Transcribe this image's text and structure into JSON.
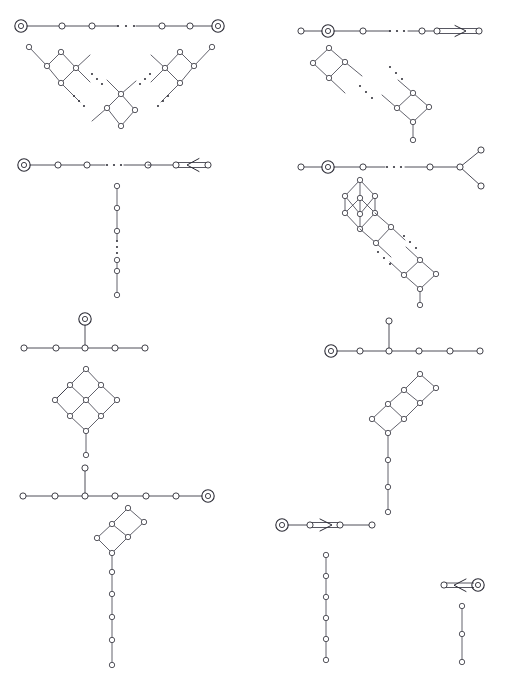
{
  "figure": {
    "type": "mathematical-diagram-plate",
    "page_label": "",
    "background_color": "#ffffff",
    "ink_color": "#2c2c36",
    "node_style": "small open circle",
    "marked_node_style": "circle inside a larger circle (double circle)",
    "ellipsis_glyph": "⋯",
    "bond_styles": [
      "single",
      "double-with-arrow-right",
      "double-with-arrow-left"
    ]
  },
  "panels": [
    {
      "id": "panel-1",
      "position": "row1-left",
      "dynkin": {
        "family": "A",
        "orientation": "horizontal-chain",
        "node_count": 6,
        "marked_nodes": [
          0,
          5
        ],
        "bond": "single",
        "has_ellipsis": true
      },
      "hasse": {
        "shape": "v-shaped-double-chain-of-diamonds",
        "node_count": 16,
        "has_ellipsis": true,
        "ellipsis_count": 4
      }
    },
    {
      "id": "panel-2",
      "position": "row1-right",
      "dynkin": {
        "family": "C",
        "orientation": "horizontal-chain",
        "node_count": 6,
        "marked_nodes": [
          1
        ],
        "bond": "double-with-arrow-right",
        "has_ellipsis": true
      },
      "hasse": {
        "shape": "diagonal-chain-of-diamonds",
        "node_count": 11,
        "has_ellipsis": true,
        "ellipsis_count": 2
      }
    },
    {
      "id": "panel-3",
      "position": "row2-left",
      "dynkin": {
        "family": "B",
        "orientation": "horizontal-chain",
        "node_count": 6,
        "marked_nodes": [
          0
        ],
        "bond": "double-with-arrow-left",
        "has_ellipsis": true
      },
      "hasse": {
        "shape": "vertical-chain",
        "node_count": 6,
        "has_ellipsis": true,
        "ellipsis_count": 3
      }
    },
    {
      "id": "panel-4",
      "position": "row2-right",
      "dynkin": {
        "family": "D",
        "orientation": "horizontal-chain-with-fork",
        "node_count": 7,
        "marked_nodes": [
          1
        ],
        "bond": "single",
        "has_ellipsis": true,
        "fork_branches": 2
      },
      "hasse": {
        "shape": "cube-on-diagonal-chain-of-diamonds",
        "node_count": 19,
        "has_ellipsis": true,
        "ellipsis_count": 2
      }
    },
    {
      "id": "panel-5",
      "position": "row3-left",
      "dynkin": {
        "family": "E6",
        "orientation": "horizontal-chain-with-top-branch",
        "node_count": 6,
        "marked_nodes": [
          5
        ],
        "bond": "single",
        "has_ellipsis": false
      },
      "hasse": {
        "shape": "three-by-three-diamond-grid-with-tail",
        "node_count": 11,
        "has_ellipsis": false
      }
    },
    {
      "id": "panel-6",
      "position": "row3-right",
      "dynkin": {
        "family": "E6",
        "orientation": "horizontal-chain-with-top-branch",
        "node_count": 6,
        "marked_nodes": [
          0
        ],
        "bond": "single",
        "has_ellipsis": false
      },
      "hasse": {
        "shape": "double-diamond-diagonal-with-long-tail",
        "node_count": 13,
        "has_ellipsis": false
      }
    },
    {
      "id": "panel-7",
      "position": "row4-left",
      "dynkin": {
        "family": "E7",
        "orientation": "horizontal-chain-with-top-branch",
        "node_count": 7,
        "marked_nodes": [
          6
        ],
        "bond": "single",
        "has_ellipsis": false
      },
      "hasse": {
        "shape": "double-diamond-with-long-vertical-tail",
        "node_count": 13,
        "has_ellipsis": false
      }
    },
    {
      "id": "panel-8",
      "position": "row4-right",
      "dynkin": {
        "family": "G2-C3",
        "orientation": "short-chains",
        "node_count": 3,
        "marked_nodes": [
          0
        ],
        "bond": "double-with-arrow-right",
        "has_ellipsis": false
      },
      "hasse": {
        "shape": "vertical-chain",
        "node_count": 6,
        "has_ellipsis": false
      }
    },
    {
      "id": "panel-9",
      "position": "row4-far-right",
      "dynkin": {
        "family": "G2",
        "orientation": "two-node",
        "node_count": 2,
        "marked_nodes": [
          1
        ],
        "bond": "double-with-arrow-left",
        "has_ellipsis": false
      },
      "hasse": {
        "shape": "vertical-chain",
        "node_count": 3,
        "has_ellipsis": false
      }
    }
  ]
}
